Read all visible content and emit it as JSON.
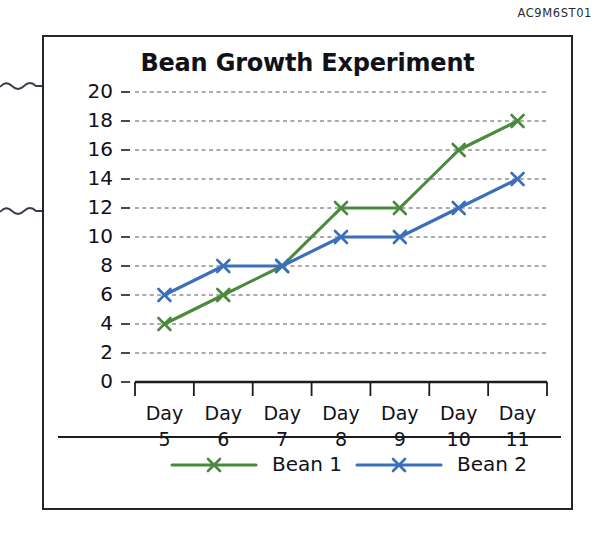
{
  "scan_code": "AC9M6ST01",
  "chart_frame": {
    "title": "Bean Growth Experiment"
  },
  "chart_data": {
    "type": "line",
    "title": "Bean Growth Experiment",
    "xlabel": "",
    "ylabel": "Height (cm)",
    "categories": [
      "Day 5",
      "Day 6",
      "Day 7",
      "Day 8",
      "Day 9",
      "Day 10",
      "Day 11"
    ],
    "category_lines": [
      [
        "Day",
        "5"
      ],
      [
        "Day",
        "6"
      ],
      [
        "Day",
        "7"
      ],
      [
        "Day",
        "8"
      ],
      [
        "Day",
        "9"
      ],
      [
        "Day",
        "10"
      ],
      [
        "Day",
        "11"
      ]
    ],
    "ylim": [
      0,
      20
    ],
    "ytick_labels": [
      "0",
      "2",
      "4",
      "6",
      "8",
      "10",
      "12",
      "14",
      "16",
      "18",
      "20"
    ],
    "ytick_values": [
      0,
      2,
      4,
      6,
      8,
      10,
      12,
      14,
      16,
      18,
      20
    ],
    "grid": true,
    "grid_axis": "y",
    "grid_style": "dashed",
    "legend_position": "bottom",
    "series": [
      {
        "name": "Bean 1",
        "color": "#4a8a3c",
        "marker": "x",
        "values": [
          4,
          6,
          8,
          12,
          12,
          16,
          18
        ]
      },
      {
        "name": "Bean 2",
        "color": "#3a6fba",
        "marker": "x",
        "values": [
          6,
          8,
          8,
          10,
          10,
          12,
          14
        ]
      }
    ]
  },
  "colors": {
    "bean1": "#4a8a3c",
    "bean2": "#3a6fba",
    "axis": "#1b1b22",
    "grid": "#8d8d96",
    "frame": "#24242c",
    "text": "#111118"
  }
}
